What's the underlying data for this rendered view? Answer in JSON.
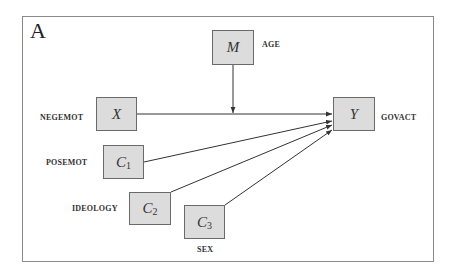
{
  "panel": {
    "letter": "A"
  },
  "nodes": {
    "M": {
      "symbol": "M",
      "subscript": "",
      "variable": "AGE"
    },
    "X": {
      "symbol": "X",
      "subscript": "",
      "variable": "NEGEMOT"
    },
    "Y": {
      "symbol": "Y",
      "subscript": "",
      "variable": "GOVACT"
    },
    "C1": {
      "symbol": "C",
      "subscript": "1",
      "variable": "POSEMOT"
    },
    "C2": {
      "symbol": "C",
      "subscript": "2",
      "variable": "IDEOLOGY"
    },
    "C3": {
      "symbol": "C",
      "subscript": "3",
      "variable": "SEX"
    }
  },
  "edges": [
    {
      "from": "X",
      "to": "Y",
      "type": "direct"
    },
    {
      "from": "M",
      "to": "X-Y path",
      "type": "moderation"
    },
    {
      "from": "C1",
      "to": "Y",
      "type": "covariate"
    },
    {
      "from": "C2",
      "to": "Y",
      "type": "covariate"
    },
    {
      "from": "C3",
      "to": "Y",
      "type": "covariate"
    }
  ],
  "colors": {
    "node_fill": "#dcdcdc",
    "node_border": "#6a6a6a",
    "line": "#333333",
    "frame": "#8a8a8a"
  }
}
